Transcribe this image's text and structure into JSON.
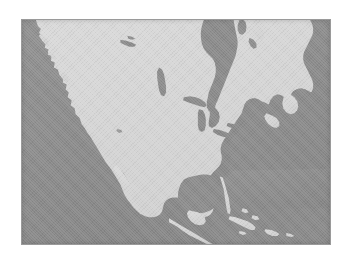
{
  "figure": {
    "kind": "map",
    "caption": "",
    "projection_hint": "conic",
    "frame": {
      "x": 21,
      "y": 19,
      "width": 310,
      "height": 226,
      "border_color": "#9a9a9a",
      "border_width_px": 1
    }
  },
  "colors": {
    "page_background": "#ffffff",
    "ocean": "#8d8d8d",
    "land": "#d7d7d7",
    "lake": "#8a8a8a",
    "frame_border": "#9a9a9a"
  },
  "legend": {
    "visible": false,
    "entries": []
  },
  "labels": {
    "visible": false,
    "items": []
  },
  "features": {
    "landmasses": [
      "North American mainland",
      "Alaska panhandle",
      "Vancouver Island",
      "Baja California peninsula",
      "Florida peninsula",
      "Yucatan peninsula",
      "Newfoundland",
      "Nova Scotia",
      "Cuba",
      "Hispaniola",
      "Jamaica",
      "Bahamas",
      "Central America isthmus"
    ],
    "water_bodies": [
      "Pacific Ocean",
      "Atlantic Ocean",
      "Hudson Bay",
      "James Bay",
      "Gulf of Mexico",
      "Caribbean Sea",
      "Gulf of California",
      "Gulf of St. Lawrence",
      "Great Lakes",
      "Lake Winnipeg",
      "Great Slave Lake",
      "Great Bear Lake"
    ],
    "great_lakes": [
      "Lake Superior",
      "Lake Michigan",
      "Lake Huron",
      "Lake Erie",
      "Lake Ontario"
    ]
  },
  "scalebar": {
    "visible": false,
    "label": ""
  },
  "north_arrow": {
    "visible": false
  },
  "graticule": {
    "visible": false
  }
}
